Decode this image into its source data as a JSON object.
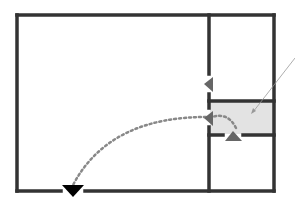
{
  "diagram": {
    "type": "floor-plan",
    "colors": {
      "wall": "#333333",
      "highlight_room": "#e3e3e3",
      "door_marker": "#666666",
      "exit_marker": "#000000",
      "path": "#888888",
      "pointer_line": "#999999"
    },
    "rooms": [
      {
        "id": "large-room",
        "label": ""
      },
      {
        "id": "upper-right-room",
        "label": ""
      },
      {
        "id": "highlighted-room",
        "label": ""
      },
      {
        "id": "lower-right-room",
        "label": ""
      }
    ],
    "markers": [
      {
        "id": "door-upper",
        "shape": "triangle-left"
      },
      {
        "id": "door-middle",
        "shape": "triangle-left"
      },
      {
        "id": "door-highlight-bottom",
        "shape": "triangle-up"
      },
      {
        "id": "exit-bottom",
        "shape": "triangle-down"
      }
    ],
    "path": {
      "style": "dotted",
      "from": "highlighted-room",
      "to": "exit-bottom"
    }
  }
}
